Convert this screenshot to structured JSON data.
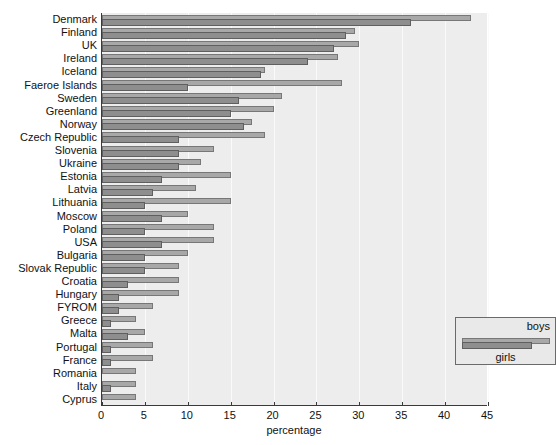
{
  "chart_data": {
    "type": "bar",
    "orientation": "horizontal",
    "title": "",
    "xlabel": "percentage",
    "ylabel": "",
    "xlim": [
      0,
      45
    ],
    "xticks": [
      0,
      5,
      10,
      15,
      20,
      25,
      30,
      35,
      40,
      45
    ],
    "grid": true,
    "legend_position": "inside-lower-right",
    "categories": [
      "Denmark",
      "Finland",
      "UK",
      "Ireland",
      "Iceland",
      "Faeroe Islands",
      "Sweden",
      "Greenland",
      "Norway",
      "Czech Republic",
      "Slovenia",
      "Ukraine",
      "Estonia",
      "Latvia",
      "Lithuania",
      "Moscow",
      "Poland",
      "USA",
      "Bulgaria",
      "Slovak Republic",
      "Croatia",
      "Hungary",
      "FYROM",
      "Greece",
      "Malta",
      "Portugal",
      "France",
      "Romania",
      "Italy",
      "Cyprus"
    ],
    "series": [
      {
        "name": "boys",
        "color": "#a8a8a8",
        "values": [
          43,
          29.5,
          30,
          27.5,
          19,
          28,
          21,
          20,
          17.5,
          19,
          13,
          11.5,
          15,
          11,
          15,
          10,
          13,
          13,
          10,
          9,
          9,
          9,
          6,
          4,
          5,
          6,
          6,
          4,
          4,
          4
        ]
      },
      {
        "name": "girls",
        "color": "#8e8e8e",
        "values": [
          36,
          28.5,
          27,
          24,
          18.5,
          10,
          16,
          15,
          16.5,
          9,
          9,
          9,
          7,
          6,
          5,
          7,
          5,
          7,
          5,
          5,
          3,
          2,
          2,
          1,
          3,
          1,
          1,
          0,
          1,
          0
        ]
      }
    ]
  },
  "legend": {
    "boys_label": "boys",
    "girls_label": "girls"
  },
  "axis": {
    "x_title": "percentage"
  }
}
